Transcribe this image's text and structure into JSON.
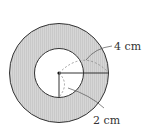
{
  "figure": {
    "type": "annulus",
    "colors": {
      "ring_fill": "#d4d4d4",
      "stroke": "#333333",
      "inner_fill": "#ffffff",
      "dashed": "#888888"
    },
    "outer_radius_label": "4 cm",
    "inner_radius_label": "2 cm"
  }
}
